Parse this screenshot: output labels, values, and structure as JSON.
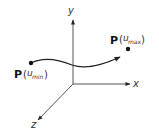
{
  "diagram": {
    "axes": {
      "x_label": "x",
      "y_label": "y",
      "z_label": "z"
    },
    "points": {
      "start": {
        "symbol": "P",
        "open": "(",
        "var": "u",
        "sub": "min",
        "close": ")"
      },
      "end": {
        "symbol": "P",
        "open": "(",
        "var": "u",
        "sub": "max",
        "close": ")"
      }
    },
    "colors": {
      "axis": "#555555",
      "curve": "#222222",
      "point": "#111111",
      "background": "#ffffff"
    }
  }
}
